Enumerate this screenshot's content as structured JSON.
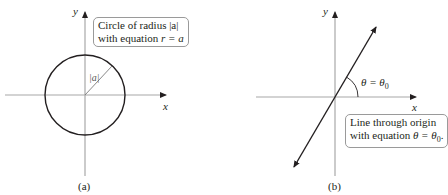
{
  "panels": [
    {
      "id": "a",
      "caption": "(a)",
      "x_axis_label": "x",
      "y_axis_label": "y",
      "radius_label": "|a|",
      "callout": {
        "line1": "Circle of radius |a|",
        "line2_prefix": "with equation ",
        "line2_eq": "r = a"
      }
    },
    {
      "id": "b",
      "caption": "(b)",
      "x_axis_label": "x",
      "y_axis_label": "y",
      "angle_label": "θ = θ",
      "angle_sub": "0",
      "callout": {
        "line1": "Line through origin",
        "line2_prefix": "with equation ",
        "line2_eq": "θ = θ",
        "line2_sub": "0",
        "line2_suffix": "."
      }
    }
  ],
  "colors": {
    "axis": "#a8a8a8",
    "curve": "#231f20",
    "box_border": "#9a9a9a"
  }
}
